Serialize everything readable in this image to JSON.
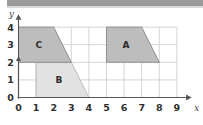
{
  "figure": {
    "title_bar_color": "#9b9b9b",
    "background_color": "#ffffff",
    "grid_color": "#c9c9cf",
    "axis_color": "#555555"
  },
  "axes": {
    "x_axis_label": "x",
    "y_axis_label": "y",
    "x_ticks": [
      "0",
      "1",
      "2",
      "3",
      "4",
      "5",
      "6",
      "7",
      "8",
      "9"
    ],
    "y_ticks": [
      "0",
      "1",
      "2",
      "3",
      "4"
    ],
    "x_range": [
      0,
      9
    ],
    "y_range": [
      0,
      4
    ],
    "grid": "on"
  },
  "shapes": [
    {
      "label": "A",
      "fill": "#bdbdbd",
      "stroke": "#8a8a8a",
      "vertices": [
        [
          5,
          4
        ],
        [
          7,
          4
        ],
        [
          8,
          2
        ],
        [
          5,
          2
        ]
      ],
      "label_position": [
        6.1,
        3.0
      ]
    },
    {
      "label": "B",
      "fill": "#e2e2e2",
      "stroke": "#b5b5b5",
      "vertices": [
        [
          1,
          2
        ],
        [
          3,
          2
        ],
        [
          4,
          0
        ],
        [
          1,
          0
        ]
      ],
      "label_position": [
        2.3,
        1.0
      ]
    },
    {
      "label": "C",
      "fill": "#bdbdbd",
      "stroke": "#8a8a8a",
      "vertices": [
        [
          0,
          4
        ],
        [
          2,
          4
        ],
        [
          3,
          2
        ],
        [
          0,
          2
        ]
      ],
      "label_position": [
        1.15,
        3.0
      ]
    }
  ],
  "chart_data": {
    "type": "scatter",
    "title": "",
    "xlabel": "x",
    "ylabel": "y",
    "xlim": [
      0,
      9
    ],
    "ylim": [
      0,
      4
    ],
    "x_tick_values": [
      0,
      1,
      2,
      3,
      4,
      5,
      6,
      7,
      8,
      9
    ],
    "y_tick_values": [
      0,
      1,
      2,
      3,
      4
    ],
    "grid": true,
    "legend": "none",
    "annotations": [
      "A",
      "B",
      "C"
    ],
    "series": [
      {
        "name": "A",
        "shape": "trapezoid",
        "values": [
          [
            5,
            4
          ],
          [
            7,
            4
          ],
          [
            8,
            2
          ],
          [
            5,
            2
          ]
        ]
      },
      {
        "name": "B",
        "shape": "trapezoid",
        "values": [
          [
            1,
            2
          ],
          [
            3,
            2
          ],
          [
            4,
            0
          ],
          [
            1,
            0
          ]
        ]
      },
      {
        "name": "C",
        "shape": "trapezoid",
        "values": [
          [
            0,
            4
          ],
          [
            2,
            4
          ],
          [
            3,
            2
          ],
          [
            0,
            2
          ]
        ]
      }
    ]
  }
}
